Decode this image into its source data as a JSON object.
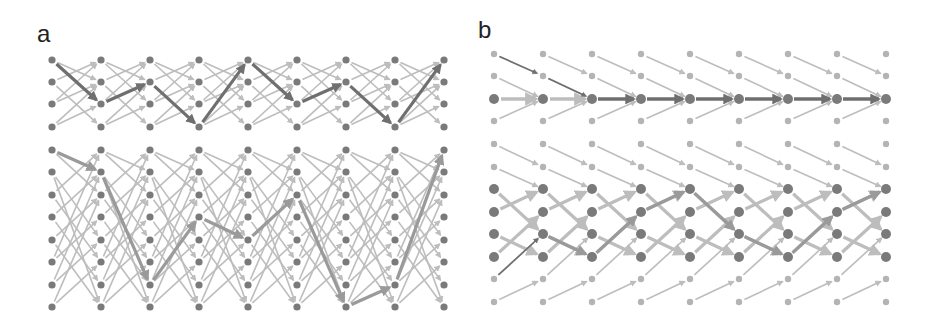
{
  "figure": {
    "panels": [
      {
        "id": "a",
        "label": "a",
        "label_pos": [
          37,
          45
        ],
        "columns_x": [
          52,
          101,
          150,
          199,
          248,
          297,
          346,
          395,
          444
        ],
        "rows_y": [
          60,
          82,
          104,
          127,
          150,
          172,
          195,
          217,
          240,
          262,
          285,
          307
        ],
        "node_radius_default": 3.6,
        "large_rows": [],
        "small_rows": [],
        "highlight_path_top": [
          [
            0,
            0
          ],
          [
            1,
            2
          ],
          [
            2,
            1
          ],
          [
            3,
            3
          ],
          [
            4,
            0
          ],
          [
            5,
            2
          ],
          [
            6,
            1
          ],
          [
            7,
            3
          ],
          [
            8,
            0
          ]
        ],
        "highlight_path_bottom": [
          [
            0,
            4
          ],
          [
            1,
            5
          ],
          [
            2,
            10
          ],
          [
            3,
            7
          ],
          [
            4,
            8
          ],
          [
            5,
            6
          ],
          [
            6,
            11
          ],
          [
            7,
            10
          ],
          [
            8,
            4
          ]
        ],
        "background_edges_top": [
          [
            0,
            1
          ],
          [
            0,
            2
          ],
          [
            1,
            3
          ],
          [
            1,
            0
          ],
          [
            2,
            1
          ],
          [
            2,
            0
          ],
          [
            3,
            2
          ],
          [
            3,
            1
          ]
        ],
        "background_edges_bottom": [
          [
            4,
            6
          ],
          [
            4,
            5
          ],
          [
            5,
            8
          ],
          [
            5,
            11
          ],
          [
            6,
            4
          ],
          [
            6,
            9
          ],
          [
            7,
            5
          ],
          [
            7,
            10
          ],
          [
            8,
            6
          ],
          [
            8,
            11
          ],
          [
            9,
            7
          ],
          [
            9,
            4
          ],
          [
            10,
            8
          ],
          [
            10,
            5
          ],
          [
            11,
            9
          ],
          [
            11,
            6
          ]
        ]
      },
      {
        "id": "b",
        "label": "b",
        "label_pos": [
          478,
          40
        ],
        "columns_x": [
          494,
          543,
          592,
          641,
          690,
          739,
          788,
          837,
          886
        ],
        "rows_y": [
          54,
          76,
          99,
          121,
          144,
          167,
          189,
          212,
          234,
          257,
          279,
          302
        ],
        "node_radius_default": 3.2,
        "large_rows": [
          2,
          6,
          7,
          8,
          9
        ],
        "small_rows": [
          0,
          1,
          3,
          4,
          5,
          10,
          11
        ],
        "highlight_path_top": [
          [
            0,
            0
          ],
          [
            1,
            1
          ],
          [
            2,
            2
          ],
          [
            3,
            2
          ],
          [
            4,
            2
          ],
          [
            5,
            2
          ],
          [
            6,
            2
          ],
          [
            7,
            2
          ],
          [
            8,
            2
          ]
        ],
        "highlight_path_bottom": [
          [
            0,
            10
          ],
          [
            1,
            8
          ],
          [
            2,
            9
          ],
          [
            3,
            7
          ],
          [
            4,
            6
          ],
          [
            5,
            8
          ],
          [
            6,
            9
          ],
          [
            7,
            7
          ],
          [
            8,
            6
          ]
        ],
        "light_thick_top": [
          [
            0,
            2,
            2
          ],
          [
            1,
            2,
            2
          ]
        ],
        "background_edges_top": [
          [
            0,
            1
          ],
          [
            1,
            2
          ],
          [
            3,
            2
          ],
          [
            4,
            5
          ],
          [
            5,
            6
          ]
        ],
        "background_edges_bottom_thick": [
          [
            6,
            8
          ],
          [
            7,
            6
          ],
          [
            8,
            9
          ],
          [
            9,
            7
          ]
        ],
        "background_edges_bottom_thin": [
          [
            10,
            8
          ],
          [
            11,
            10
          ]
        ]
      }
    ],
    "colors": {
      "node": "#7a7a7a",
      "node_light": "#b4b4b4",
      "edge_light": "#bdbdbd",
      "edge_medium": "#9a9a9a",
      "edge_dark": "#6f6f6f",
      "background": "#ffffff"
    }
  }
}
